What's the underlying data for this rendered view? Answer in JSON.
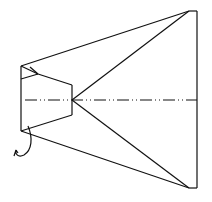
{
  "diagram": {
    "title": "",
    "stroke_color": "#111111",
    "background": "#ffffff",
    "labels": []
  }
}
